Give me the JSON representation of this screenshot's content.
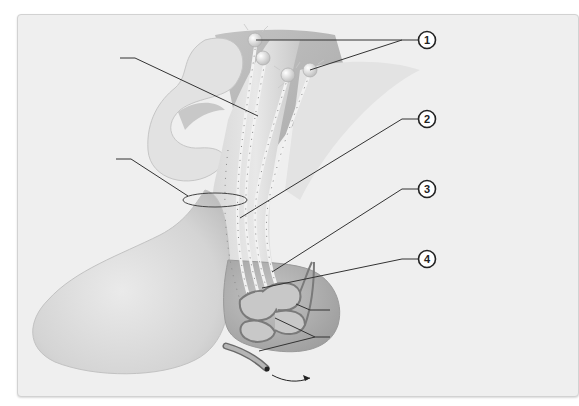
{
  "figure": {
    "type": "anatomical-diagram",
    "background_color": "#efefef",
    "tissue_color": "#d6d6d6",
    "line_color": "#333333"
  },
  "callouts": [
    {
      "id": 1,
      "label": "1"
    },
    {
      "id": 2,
      "label": "2"
    },
    {
      "id": 3,
      "label": "3"
    },
    {
      "id": 4,
      "label": "4"
    }
  ],
  "blank_labels": [
    {
      "position": "upper-left"
    },
    {
      "position": "middle-left"
    },
    {
      "position": "lower-right-upper"
    },
    {
      "position": "lower-right-lower"
    }
  ],
  "arrow": {
    "direction": "right",
    "meaning": "blood flow out"
  }
}
